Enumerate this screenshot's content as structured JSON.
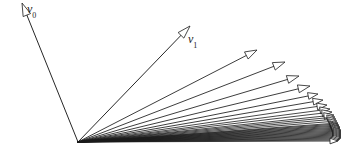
{
  "figure": {
    "name": "vector-sequence-fan",
    "background_color": "#ffffff",
    "stroke_color": "#1a1a1a",
    "width": 355,
    "height": 151,
    "origin": {
      "x": 78,
      "y": 142
    }
  },
  "labels": [
    {
      "id": "v0",
      "base": "v",
      "subscript": "0",
      "x": 27,
      "y": 3
    },
    {
      "id": "v1",
      "base": "v",
      "subscript": "1",
      "x": 188,
      "y": 33
    }
  ],
  "chart_data": {
    "type": "scatter",
    "title": "",
    "xlabel": "",
    "ylabel": "",
    "grid": false,
    "origin": {
      "x": 78,
      "y": 142
    },
    "vectors": [
      {
        "name": "v0",
        "angle_deg": 114.0,
        "length": 147.0,
        "tip_x": 22,
        "tip_y": 3,
        "labeled": true,
        "arrowhead": "open"
      },
      {
        "name": "v1",
        "angle_deg": 44.0,
        "length": 161.0,
        "tip_x": 190,
        "tip_y": 26,
        "labeled": true,
        "arrowhead": "open"
      },
      {
        "name": "v2",
        "angle_deg": 29.0,
        "length": 204.0,
        "tip_x": 257,
        "tip_y": 50,
        "labeled": false,
        "arrowhead": "open"
      },
      {
        "name": "v3",
        "angle_deg": 21.0,
        "length": 222.0,
        "tip_x": 285,
        "tip_y": 62,
        "labeled": false,
        "arrowhead": "open"
      },
      {
        "name": "v4",
        "angle_deg": 16.5,
        "length": 231.0,
        "tip_x": 299,
        "tip_y": 76,
        "labeled": false,
        "arrowhead": "open"
      },
      {
        "name": "v5",
        "angle_deg": 13.0,
        "length": 239.0,
        "tip_x": 310,
        "tip_y": 86,
        "labeled": false,
        "arrowhead": "open"
      },
      {
        "name": "v6",
        "angle_deg": 10.5,
        "length": 244.0,
        "tip_x": 318,
        "tip_y": 94,
        "labeled": false,
        "arrowhead": "open"
      },
      {
        "name": "v7",
        "angle_deg": 8.8,
        "length": 248.0,
        "tip_x": 323,
        "tip_y": 100,
        "labeled": false,
        "arrowhead": "open"
      },
      {
        "name": "v8",
        "angle_deg": 7.4,
        "length": 251.0,
        "tip_x": 327,
        "tip_y": 105,
        "labeled": false,
        "arrowhead": "open"
      },
      {
        "name": "v9",
        "angle_deg": 6.3,
        "length": 253.0,
        "tip_x": 330,
        "tip_y": 109,
        "labeled": false,
        "arrowhead": "open"
      },
      {
        "name": "v10",
        "angle_deg": 5.4,
        "length": 255.0,
        "tip_x": 332,
        "tip_y": 112,
        "labeled": false,
        "arrowhead": "open"
      },
      {
        "name": "v11",
        "angle_deg": 4.7,
        "length": 257.0,
        "tip_x": 334,
        "tip_y": 115,
        "labeled": false,
        "arrowhead": "open"
      },
      {
        "name": "v12",
        "angle_deg": 4.1,
        "length": 258.0,
        "tip_x": 335,
        "tip_y": 117,
        "labeled": false,
        "arrowhead": "open"
      },
      {
        "name": "v13",
        "angle_deg": 3.6,
        "length": 259.0,
        "tip_x": 336,
        "tip_y": 119,
        "labeled": false,
        "arrowhead": "open"
      },
      {
        "name": "v14",
        "angle_deg": 3.1,
        "length": 260.0,
        "tip_x": 337,
        "tip_y": 121,
        "labeled": false,
        "arrowhead": "open"
      },
      {
        "name": "v15",
        "angle_deg": 2.7,
        "length": 261.0,
        "tip_x": 338,
        "tip_y": 123,
        "labeled": false,
        "arrowhead": "open"
      },
      {
        "name": "v16",
        "angle_deg": 2.4,
        "length": 261.5,
        "tip_x": 338,
        "tip_y": 124,
        "labeled": false,
        "arrowhead": "open"
      },
      {
        "name": "v17",
        "angle_deg": 2.1,
        "length": 262.0,
        "tip_x": 339,
        "tip_y": 125,
        "labeled": false,
        "arrowhead": "open"
      },
      {
        "name": "v18",
        "angle_deg": 1.8,
        "length": 262.5,
        "tip_x": 339,
        "tip_y": 126,
        "labeled": false,
        "arrowhead": "open"
      },
      {
        "name": "v19",
        "angle_deg": 1.55,
        "length": 263.0,
        "tip_x": 340,
        "tip_y": 127,
        "labeled": false,
        "arrowhead": "open"
      },
      {
        "name": "v20",
        "angle_deg": 1.3,
        "length": 263.0,
        "tip_x": 340,
        "tip_y": 128,
        "labeled": false,
        "arrowhead": "open"
      },
      {
        "name": "v21",
        "angle_deg": 1.1,
        "length": 263.5,
        "tip_x": 340,
        "tip_y": 129,
        "labeled": false,
        "arrowhead": "open"
      },
      {
        "name": "v22",
        "angle_deg": 0.9,
        "length": 263.5,
        "tip_x": 341,
        "tip_y": 130,
        "labeled": false,
        "arrowhead": "open"
      },
      {
        "name": "v23",
        "angle_deg": 0.7,
        "length": 264.0,
        "tip_x": 341,
        "tip_y": 131,
        "labeled": false,
        "arrowhead": "open"
      },
      {
        "name": "v24",
        "angle_deg": 0.55,
        "length": 264.0,
        "tip_x": 341,
        "tip_y": 132,
        "labeled": false,
        "arrowhead": "open"
      },
      {
        "name": "v25",
        "angle_deg": 0.4,
        "length": 264.0,
        "tip_x": 341,
        "tip_y": 133,
        "labeled": false,
        "arrowhead": "open"
      },
      {
        "name": "v26",
        "angle_deg": 0.25,
        "length": 264.0,
        "tip_x": 341,
        "tip_y": 134,
        "labeled": false,
        "arrowhead": "open"
      },
      {
        "name": "v27",
        "angle_deg": 0.1,
        "length": 264.0,
        "tip_x": 341,
        "tip_y": 135,
        "labeled": false,
        "arrowhead": "open"
      },
      {
        "name": "v28",
        "angle_deg": -0.1,
        "length": 264.0,
        "tip_x": 341,
        "tip_y": 136,
        "labeled": false,
        "arrowhead": "open"
      },
      {
        "name": "v29",
        "angle_deg": -0.3,
        "length": 264.0,
        "tip_x": 341,
        "tip_y": 137,
        "labeled": false,
        "arrowhead": "open"
      },
      {
        "name": "v30",
        "angle_deg": -0.5,
        "length": 263.5,
        "tip_x": 341,
        "tip_y": 138,
        "labeled": false,
        "arrowhead": "open"
      },
      {
        "name": "v31",
        "angle_deg": -0.75,
        "length": 263.0,
        "tip_x": 340,
        "tip_y": 139,
        "labeled": false,
        "arrowhead": "open"
      },
      {
        "name": "v32",
        "angle_deg": -1.0,
        "length": 262.0,
        "tip_x": 339,
        "tip_y": 140,
        "labeled": false,
        "arrowhead": "open"
      },
      {
        "name": "v33",
        "angle_deg": -1.3,
        "length": 260.0,
        "tip_x": 338,
        "tip_y": 141,
        "labeled": false,
        "arrowhead": "open"
      }
    ]
  }
}
